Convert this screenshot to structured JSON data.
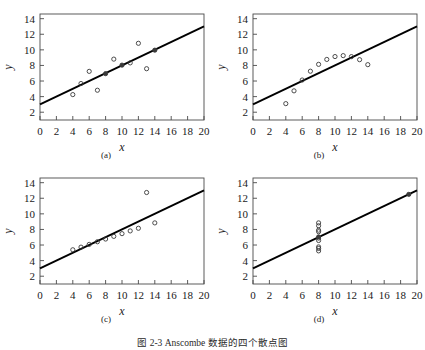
{
  "figure": {
    "caption": "图 2-3  Anscombe 数据的四个散点图",
    "caption_visible_fragment": "图 2-3  Anscombe 数据的四个散点图"
  },
  "axes": {
    "xlabel": "x",
    "ylabel": "y",
    "x_ticks": [
      "0",
      "2",
      "4",
      "6",
      "8",
      "10",
      "12",
      "14",
      "16",
      "18",
      "20"
    ],
    "y_ticks": [
      "2",
      "4",
      "6",
      "8",
      "10",
      "12",
      "14"
    ],
    "xlim": [
      0,
      20
    ],
    "ylim": [
      1,
      14.6
    ],
    "grid": false
  },
  "style": {
    "line_color": "#000000",
    "marker_color": "#3a3a3a",
    "axis_color": "#4a4a4a",
    "background": "#ffffff"
  },
  "panels": [
    {
      "id": "a",
      "label": "(a)"
    },
    {
      "id": "b",
      "label": "(b)"
    },
    {
      "id": "c",
      "label": "(c)"
    },
    {
      "id": "d",
      "label": "(d)"
    }
  ],
  "chart_data": [
    {
      "type": "scatter",
      "title": "(a)",
      "xlabel": "x",
      "ylabel": "y",
      "xlim": [
        0,
        20
      ],
      "ylim": [
        1,
        14.6
      ],
      "grid": false,
      "x": [
        10,
        8,
        13,
        9,
        11,
        14,
        6,
        4,
        12,
        7,
        5
      ],
      "y": [
        8.04,
        6.95,
        7.58,
        8.81,
        8.33,
        9.96,
        7.24,
        4.26,
        10.84,
        4.82,
        5.68
      ],
      "fit_line": {
        "intercept": 3.0,
        "slope": 0.5,
        "x_from": 0,
        "x_to": 20
      }
    },
    {
      "type": "scatter",
      "title": "(b)",
      "xlabel": "x",
      "ylabel": "y",
      "xlim": [
        0,
        20
      ],
      "ylim": [
        1,
        14.6
      ],
      "grid": false,
      "x": [
        10,
        8,
        13,
        9,
        11,
        14,
        6,
        4,
        12,
        7,
        5
      ],
      "y": [
        9.14,
        8.14,
        8.74,
        8.77,
        9.26,
        8.1,
        6.13,
        3.1,
        9.13,
        7.26,
        4.74
      ],
      "fit_line": {
        "intercept": 3.0,
        "slope": 0.5,
        "x_from": 0,
        "x_to": 20
      }
    },
    {
      "type": "scatter",
      "title": "(c)",
      "xlabel": "x",
      "ylabel": "y",
      "xlim": [
        0,
        20
      ],
      "ylim": [
        1,
        14.6
      ],
      "grid": false,
      "x": [
        10,
        8,
        13,
        9,
        11,
        14,
        6,
        4,
        12,
        7,
        5
      ],
      "y": [
        7.46,
        6.77,
        12.74,
        7.11,
        7.81,
        8.84,
        6.08,
        5.39,
        8.15,
        6.42,
        5.73
      ],
      "fit_line": {
        "intercept": 3.0,
        "slope": 0.5,
        "x_from": 0,
        "x_to": 20
      }
    },
    {
      "type": "scatter",
      "title": "(d)",
      "xlabel": "x",
      "ylabel": "y",
      "xlim": [
        0,
        20
      ],
      "ylim": [
        1,
        14.6
      ],
      "grid": false,
      "x": [
        8,
        8,
        8,
        8,
        8,
        8,
        8,
        19,
        8,
        8,
        8
      ],
      "y": [
        6.58,
        5.76,
        7.71,
        8.84,
        8.47,
        7.04,
        5.25,
        12.5,
        5.56,
        7.91,
        6.89
      ],
      "fit_line": {
        "intercept": 3.0,
        "slope": 0.5,
        "x_from": 0,
        "x_to": 20
      }
    }
  ]
}
